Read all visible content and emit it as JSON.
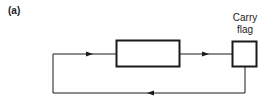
{
  "figure": {
    "label": "(a)",
    "carry_flag": {
      "line1": "Carry",
      "line2": "flag"
    },
    "colors": {
      "stroke": "#1a1a1a",
      "background": "#ffffff"
    }
  }
}
